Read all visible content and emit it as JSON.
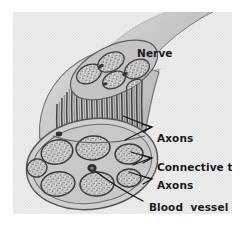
{
  "figure": {
    "kind": "anatomical-illustration",
    "labels": {
      "nerve": "Nerve",
      "axons_upper": "Axons",
      "connective_tissue": "Connective tissue",
      "axons_lower": "Axons",
      "blood_vessel": "Blood  vessel"
    },
    "colors": {
      "paper": "#eeeeee",
      "paper_dither": "#e2e2e2",
      "ink": "#1b1b1b",
      "trunk_light": "#d2d2d2",
      "trunk_mid": "#b0b0b0",
      "trunk_dark": "#8d8d8d",
      "sheath": "#9a9a9a",
      "fascicle_fill": "#d8d8d8",
      "fascicle_outline": "#4a4a4a",
      "fiber_stripe": "#3a3a3a",
      "page_background": "#ffffff"
    },
    "parts": {
      "fascicle_count_cross_section": 7,
      "fascicle_count_cut_face": 5,
      "axon_fiber_bundles": 34
    }
  }
}
